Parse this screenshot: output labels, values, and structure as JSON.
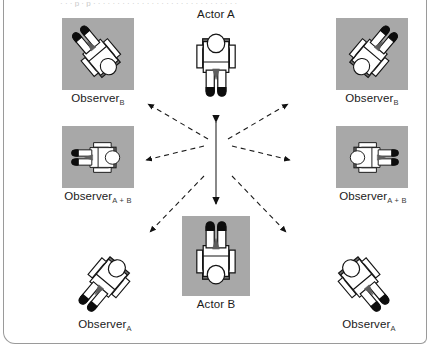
{
  "caption_strip": {
    "text": "· · ·  p  ·  p  ·  ·  ·   ·  ·  ·  ·   ·  ·  ·  ·  ·  ·  ·  ·  ·  ·   ·  ·  ·  ·  ·  ·  ·  ·  ·  ·  ·  ·  ·"
  },
  "colors": {
    "plate_gray": "#a8a8a8",
    "figure_fill": "#ffffff",
    "figure_outline": "#141414",
    "shoe_black": "#0d0d0d",
    "shoulder_gray": "#6e6e6e",
    "crotch_gray": "#5e5e5e",
    "arrow_dashed": "#1a1a1a",
    "arrow_solid": "#6b6b6b",
    "page_border": "#9a9a9a",
    "background": "#ffffff"
  },
  "center": {
    "x": 216,
    "y": 163
  },
  "actors": [
    {
      "id": "actor-a",
      "label": "Actor A",
      "label_sub": "",
      "label_position": "above",
      "plate": false,
      "rotation": 0,
      "mirrored": false,
      "box": {
        "x": 182,
        "y": 22,
        "w": 68,
        "h": 80
      },
      "caption_box": {
        "x": 182,
        "y": 8,
        "w": 68
      }
    },
    {
      "id": "actor-b",
      "label": "Actor B",
      "label_sub": "",
      "label_position": "below",
      "plate": true,
      "rotation": 180,
      "mirrored": false,
      "box": {
        "x": 182,
        "y": 216,
        "w": 68,
        "h": 80
      },
      "caption_box": {
        "x": 182,
        "y": 298,
        "w": 68
      }
    }
  ],
  "observers": [
    {
      "id": "observer-top-left",
      "label": "Observer",
      "label_sub": "B",
      "plate": true,
      "rotation": 140,
      "mirrored": false,
      "box": {
        "x": 62,
        "y": 18,
        "w": 72,
        "h": 72
      },
      "caption_box": {
        "x": 62,
        "y": 92,
        "w": 72
      }
    },
    {
      "id": "observer-top-right",
      "label": "Observer",
      "label_sub": "B",
      "plate": true,
      "rotation": 220,
      "mirrored": true,
      "box": {
        "x": 336,
        "y": 18,
        "w": 72,
        "h": 72
      },
      "caption_box": {
        "x": 336,
        "y": 92,
        "w": 72
      }
    },
    {
      "id": "observer-mid-left",
      "label": "Observer",
      "label_sub": "A + B",
      "plate": true,
      "rotation": 90,
      "mirrored": false,
      "box": {
        "x": 62,
        "y": 126,
        "w": 72,
        "h": 62
      },
      "caption_box": {
        "x": 55,
        "y": 190,
        "w": 86
      }
    },
    {
      "id": "observer-mid-right",
      "label": "Observer",
      "label_sub": "A + B",
      "plate": true,
      "rotation": 270,
      "mirrored": true,
      "box": {
        "x": 336,
        "y": 126,
        "w": 72,
        "h": 62
      },
      "caption_box": {
        "x": 330,
        "y": 190,
        "w": 86
      }
    },
    {
      "id": "observer-bottom-left",
      "label": "Observer",
      "label_sub": "A",
      "plate": false,
      "rotation": 40,
      "mirrored": false,
      "box": {
        "x": 66,
        "y": 244,
        "w": 80,
        "h": 76
      },
      "caption_box": {
        "x": 62,
        "y": 318,
        "w": 86
      }
    },
    {
      "id": "observer-bottom-right",
      "label": "Observer",
      "label_sub": "A",
      "plate": false,
      "rotation": 320,
      "mirrored": true,
      "box": {
        "x": 322,
        "y": 244,
        "w": 80,
        "h": 76
      },
      "caption_box": {
        "x": 326,
        "y": 318,
        "w": 86
      }
    }
  ],
  "arrows": {
    "solid": {
      "name": "actor-a-to-actor-b-arrow",
      "style": "solid",
      "double_headed": true,
      "from": {
        "x": 216,
        "y": 122
      },
      "to": {
        "x": 216,
        "y": 204
      }
    },
    "dashed": [
      {
        "name": "arrow-center-to-observer-top-left",
        "from": {
          "x": 208,
          "y": 139
        },
        "to": {
          "x": 148,
          "y": 104
        }
      },
      {
        "name": "arrow-center-to-observer-top-right",
        "from": {
          "x": 228,
          "y": 139
        },
        "to": {
          "x": 288,
          "y": 104
        }
      },
      {
        "name": "arrow-center-to-observer-mid-left",
        "from": {
          "x": 204,
          "y": 146
        },
        "to": {
          "x": 146,
          "y": 160
        }
      },
      {
        "name": "arrow-center-to-observer-mid-right",
        "from": {
          "x": 232,
          "y": 146
        },
        "to": {
          "x": 290,
          "y": 160
        }
      },
      {
        "name": "arrow-center-to-observer-bottom-left",
        "from": {
          "x": 204,
          "y": 176
        },
        "to": {
          "x": 150,
          "y": 232
        }
      },
      {
        "name": "arrow-center-to-observer-bottom-right",
        "from": {
          "x": 232,
          "y": 176
        },
        "to": {
          "x": 286,
          "y": 232
        }
      }
    ]
  }
}
